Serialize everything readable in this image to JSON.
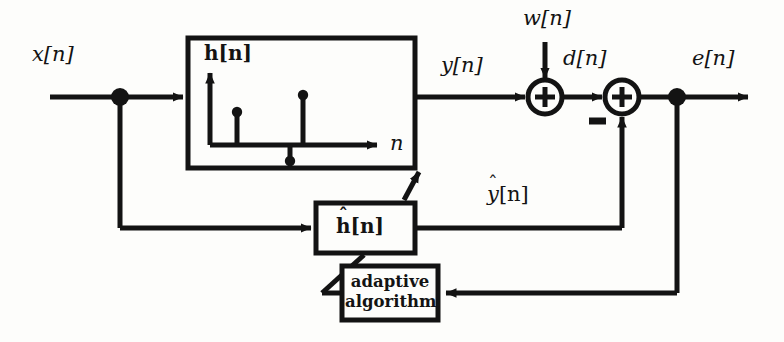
{
  "figure": {
    "type": "block-diagram",
    "ink_color": "#131313",
    "background_color": "#fdfdfb"
  },
  "signals": {
    "input": "x[n]",
    "plant_output": "y[n]",
    "noise": "w[n]",
    "desired": "d[n]",
    "error": "e[n]",
    "filter_output_hat": "ŷ[n]",
    "filter_output_base": "y",
    "filter_output_hat_mark": "ˆ",
    "filter_output_brackets": "[n]"
  },
  "blocks": {
    "plant": {
      "label_base": "h",
      "label_brackets": "[n]",
      "label": "h[n]",
      "axis_label": "n"
    },
    "adaptive_filter": {
      "label_base": "h",
      "label_hat": "ˆ",
      "label_brackets": "[n]",
      "label": "ĥ[n]"
    },
    "adaptive_algorithm": {
      "line1": "adaptive",
      "line2": "algorithm"
    }
  },
  "operators": {
    "sum1_symbol": "+",
    "sum2_symbol": "+",
    "negative_sign": "−"
  },
  "stem_plot": {
    "type": "stem",
    "description": "Impulse response h[n] sample stems inside plant block",
    "xlabel": "n",
    "ylabel": "h[n]",
    "x": [
      0,
      1,
      2,
      3
    ],
    "values": [
      0,
      0.48,
      -0.22,
      0.78
    ]
  }
}
